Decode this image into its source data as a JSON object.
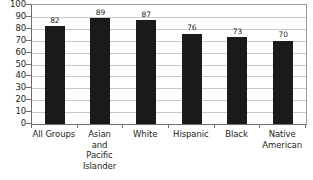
{
  "chart_data": {
    "type": "bar",
    "title": "",
    "subtitle": "",
    "xlabel": "",
    "ylabel": "",
    "ylim": [
      0,
      100
    ],
    "yticks": [
      0,
      10,
      20,
      30,
      40,
      50,
      60,
      70,
      80,
      90,
      100
    ],
    "grid": true,
    "legend": false,
    "legend_position": "none",
    "bar_color": "#1a1a1a",
    "gridline_color": "#c8c8c8",
    "axis_color": "#6e6e6e",
    "text_color": "#231f20",
    "categories": [
      "All Groups",
      "Asian\nand\nPacific\nIslander",
      "White",
      "Hispanic",
      "Black",
      "Native\nAmerican"
    ],
    "values": [
      82,
      89,
      87,
      76,
      73,
      70
    ],
    "value_labels": [
      "82",
      "89",
      "87",
      "76",
      "73",
      "70"
    ]
  },
  "yticks_text": {
    "t0": "0",
    "t1": "10",
    "t2": "20",
    "t3": "30",
    "t4": "40",
    "t5": "50",
    "t6": "60",
    "t7": "70",
    "t8": "80",
    "t9": "90",
    "t10": "100"
  }
}
